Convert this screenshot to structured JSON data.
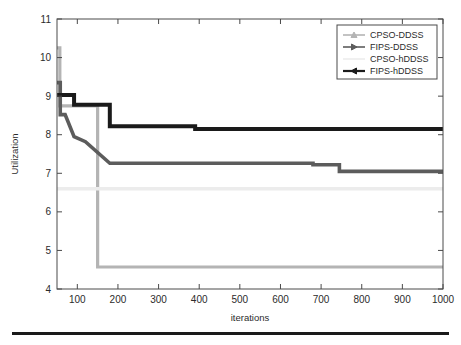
{
  "figure": {
    "background_color": "#ffffff",
    "axis_color": "#4a4a4a",
    "bottom_rule_color": "#1a1a1a"
  },
  "axes": {
    "xlabel": "iterations",
    "ylabel": "Utilization",
    "x_ticks": [
      "100",
      "200",
      "300",
      "400",
      "500",
      "600",
      "700",
      "800",
      "900",
      "1000"
    ],
    "x_tick_values": [
      100,
      200,
      300,
      400,
      500,
      600,
      700,
      800,
      900,
      1000
    ],
    "y_ticks": [
      "4",
      "5",
      "6",
      "7",
      "8",
      "9",
      "10",
      "11"
    ],
    "y_tick_values": [
      4,
      5,
      6,
      7,
      8,
      9,
      10,
      11
    ],
    "xlim": [
      50,
      1000
    ],
    "ylim": [
      4,
      11
    ],
    "grid": false
  },
  "legend": {
    "position": "top-right",
    "items": [
      {
        "label": "CPSO-DDSS",
        "color": "#b4b4b4",
        "marker": "triangle-up"
      },
      {
        "label": "FIPS-DDSS",
        "color": "#5c5c5c",
        "marker": "triangle-right"
      },
      {
        "label": "CPSO-hDDSS",
        "color": "#ececec",
        "marker": "none"
      },
      {
        "label": "FIPS-hDDSS",
        "color": "#1a1a1a",
        "marker": "triangle-left"
      }
    ]
  },
  "chart_data": {
    "type": "line",
    "title": "",
    "subtitle": "",
    "xlabel": "iterations",
    "ylabel": "Utilization",
    "xlim": [
      50,
      1000
    ],
    "ylim": [
      4,
      11
    ],
    "grid": false,
    "legend_position": "top-right",
    "step_style": "post",
    "series": [
      {
        "name": "CPSO-DDSS",
        "color": "#b4b4b4",
        "marker": "triangle-up",
        "x": [
          50,
          57,
          57,
          150,
          150,
          1000
        ],
        "y": [
          10.25,
          10.25,
          8.75,
          8.75,
          4.57,
          4.57
        ]
      },
      {
        "name": "FIPS-DDSS",
        "color": "#5c5c5c",
        "marker": "triangle-right",
        "x": [
          50,
          58,
          58,
          70,
          70,
          92,
          92,
          120,
          120,
          180,
          180,
          680,
          680,
          745,
          745,
          1000
        ],
        "y": [
          9.35,
          9.35,
          8.52,
          8.52,
          8.52,
          7.95,
          7.95,
          7.82,
          7.82,
          7.26,
          7.26,
          7.26,
          7.22,
          7.22,
          7.05,
          7.05
        ]
      },
      {
        "name": "CPSO-hDDSS",
        "color": "#ececec",
        "marker": "none",
        "x": [
          50,
          1000
        ],
        "y": [
          6.6,
          6.6
        ]
      },
      {
        "name": "FIPS-hDDSS",
        "color": "#1a1a1a",
        "marker": "triangle-left",
        "x": [
          50,
          92,
          92,
          180,
          180,
          390,
          390,
          1000
        ],
        "y": [
          9.03,
          9.03,
          8.78,
          8.78,
          8.22,
          8.22,
          8.15,
          8.15
        ]
      }
    ]
  }
}
